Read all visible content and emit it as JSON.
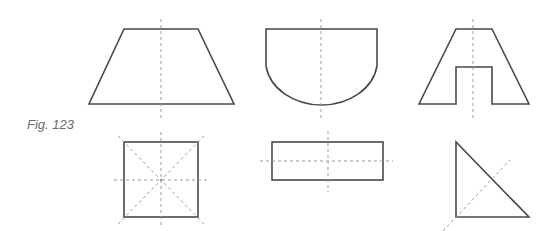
{
  "figure": {
    "label": "Fig. 123",
    "colors": {
      "outline": "#4a4a4a",
      "centerline": "#9a9a9a",
      "label": "#6a6a6a",
      "background": "#ffffff"
    },
    "views": [
      {
        "id": "trapezoid",
        "row": "top",
        "type": "front-view",
        "shape": "trapezoid",
        "centerlines": [
          "vertical"
        ]
      },
      {
        "id": "d-shape",
        "row": "top",
        "type": "front-view",
        "shape": "rectangle-with-arc-bottom",
        "centerlines": [
          "vertical"
        ]
      },
      {
        "id": "a-shape",
        "row": "top",
        "type": "front-view",
        "shape": "trapezoid-with-rectangular-notch",
        "centerlines": [
          "vertical"
        ]
      },
      {
        "id": "square",
        "row": "bottom",
        "type": "top-view",
        "shape": "square",
        "centerlines": [
          "vertical",
          "horizontal",
          "diagonal",
          "diagonal"
        ]
      },
      {
        "id": "rectangle",
        "row": "bottom",
        "type": "top-view",
        "shape": "rectangle",
        "centerlines": [
          "vertical",
          "horizontal"
        ]
      },
      {
        "id": "triangle",
        "row": "bottom",
        "type": "top-view",
        "shape": "right-triangle",
        "centerlines": [
          "diagonal"
        ]
      }
    ]
  }
}
